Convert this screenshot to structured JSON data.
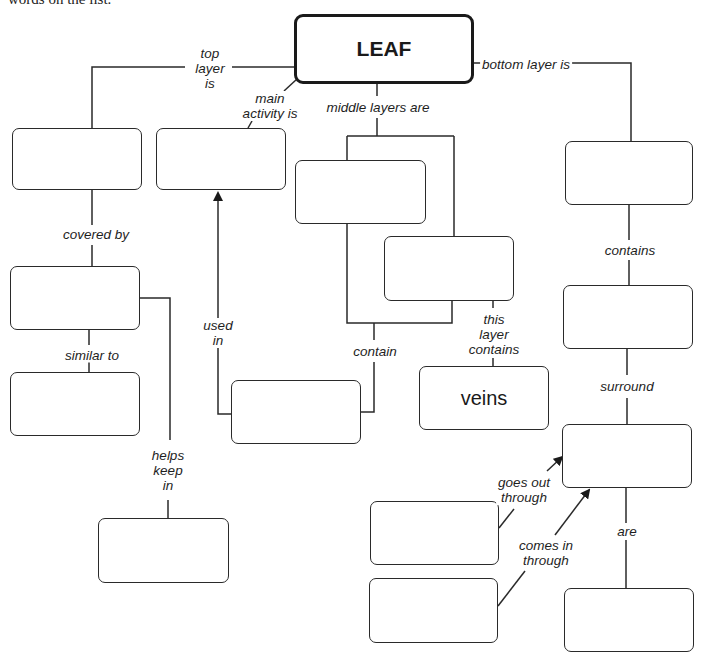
{
  "intro_text": "words on the list.",
  "root": {
    "label": "LEAF"
  },
  "nodes": {
    "top_layer": "",
    "main_activity": "",
    "middle_layer_1": "",
    "middle_layer_2": "",
    "bottom_layer": "",
    "covering": "",
    "similar_to": "",
    "used_in_source": "",
    "veins": "veins",
    "bottom_contents": "",
    "surrounded": "",
    "goes_out": "",
    "comes_in": "",
    "kept_in": "",
    "are": ""
  },
  "links": {
    "top_layer_is": "top\nlayer\nis",
    "main_activity_is": "main\nactivity is",
    "middle_layers_are": "middle layers are",
    "bottom_layer_is": "bottom layer is",
    "covered_by": "covered by",
    "similar_to": "similar to",
    "helps_keep_in": "helps\nkeep\nin",
    "used_in": "used\nin",
    "contain": "contain",
    "this_layer_contains": "this\nlayer\ncontains",
    "contains": "contains",
    "surround": "surround",
    "goes_out_through": "goes out\nthrough",
    "comes_in_through": "comes in\nthrough",
    "are": "are"
  },
  "colors": {
    "line": "#2a2a2a",
    "background": "#ffffff"
  }
}
